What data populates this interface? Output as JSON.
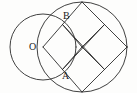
{
  "figure": {
    "background_color": "#fdfdfc",
    "stroke_color": "#2b2b2b",
    "stroke_width": 0.9,
    "width": 137,
    "height": 93,
    "labels": [
      {
        "id": "O",
        "text": "O",
        "x": 29,
        "y": 42,
        "meaning": "center-of-small-circle"
      },
      {
        "id": "B",
        "text": "B",
        "x": 63,
        "y": 11,
        "meaning": "upper-circle-intersection-point"
      },
      {
        "id": "A",
        "text": "A",
        "x": 62,
        "y": 71,
        "meaning": "lower-circle-intersection-point"
      }
    ],
    "circles": [
      {
        "id": "small-circle",
        "cx": 43,
        "cy": 47,
        "r": 33,
        "label": "O"
      },
      {
        "id": "large-circle",
        "cx": 82,
        "cy": 47,
        "r": 45,
        "label": ""
      }
    ],
    "points": {
      "O": {
        "x": 43,
        "y": 47
      },
      "B": {
        "x": 70.5,
        "y": 21.5
      },
      "A": {
        "x": 70.5,
        "y": 72.5
      },
      "diamond_top": {
        "x": 82,
        "y": 2
      },
      "diamond_left": {
        "x": 43,
        "y": 47
      },
      "diamond_bottom": {
        "x": 82,
        "y": 92
      },
      "diamond_right": {
        "x": 127,
        "y": 47
      },
      "mid_top_left": {
        "x": 62.5,
        "y": 24.5
      },
      "mid_top_right": {
        "x": 104.5,
        "y": 24.5
      },
      "mid_bottom_left": {
        "x": 62.5,
        "y": 69.5
      },
      "mid_bottom_right": {
        "x": 104.5,
        "y": 69.5
      },
      "center": {
        "x": 82,
        "y": 47
      }
    },
    "segments": [
      {
        "id": "diamond-edge-top-left",
        "x1": 82,
        "y1": 2,
        "x2": 43,
        "y2": 47
      },
      {
        "id": "diamond-edge-bottom-left",
        "x1": 43,
        "y1": 47,
        "x2": 82,
        "y2": 92
      },
      {
        "id": "diamond-edge-bottom-right",
        "x1": 82,
        "y1": 92,
        "x2": 127,
        "y2": 47
      },
      {
        "id": "diamond-edge-top-right",
        "x1": 127,
        "y1": 47,
        "x2": 82,
        "y2": 2
      },
      {
        "id": "median-horizontal",
        "x1": 62.5,
        "y1": 24.5,
        "x2": 104.5,
        "y2": 69.5
      },
      {
        "id": "median-vertical",
        "x1": 62.5,
        "y1": 69.5,
        "x2": 104.5,
        "y2": 24.5
      },
      {
        "id": "inner-square-nw",
        "x1": 62.5,
        "y1": 24.5,
        "x2": 82,
        "y2": 47
      },
      {
        "id": "inner-square-ne",
        "x1": 82,
        "y1": 47,
        "x2": 104.5,
        "y2": 24.5
      },
      {
        "id": "inner-square-sw",
        "x1": 62.5,
        "y1": 69.5,
        "x2": 82,
        "y2": 47
      },
      {
        "id": "inner-square-se",
        "x1": 82,
        "y1": 47,
        "x2": 104.5,
        "y2": 69.5
      }
    ],
    "notes": {
      "figure_type": "plane-geometry-diagram",
      "shape_summary": "A small circle centered at O overlaps a larger circle; a square rotated 45 degrees is inscribed in the larger circle and subdivided into four congruent smaller tilted squares. Points A and B mark where the two circles intersect."
    }
  }
}
